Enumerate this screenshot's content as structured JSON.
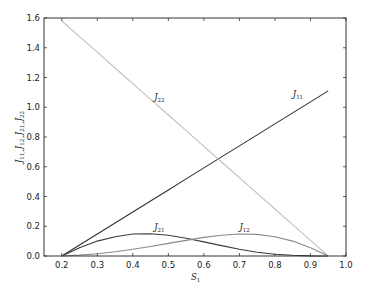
{
  "chart_data": {
    "type": "line",
    "title": "",
    "xlabel": "S_1",
    "ylabel": "J_11, J_12, J_21, J_22",
    "xlim": [
      0.15,
      1.0
    ],
    "ylim": [
      0.0,
      1.6
    ],
    "grid": false,
    "legend": "none (inline curve labels)",
    "xticks": [
      "0.2",
      "0.3",
      "0.4",
      "0.5",
      "0.6",
      "0.7",
      "0.8",
      "0.9",
      "1.0"
    ],
    "yticks": [
      "0.0",
      "0.2",
      "0.4",
      "0.6",
      "0.8",
      "1.0",
      "1.2",
      "1.4",
      "1.6"
    ],
    "x": [
      0.2,
      0.25,
      0.3,
      0.35,
      0.4,
      0.45,
      0.5,
      0.55,
      0.6,
      0.65,
      0.7,
      0.75,
      0.8,
      0.85,
      0.9,
      0.95
    ],
    "series": [
      {
        "name": "J_11",
        "color": "#333333",
        "values": [
          0.0,
          0.074,
          0.148,
          0.222,
          0.296,
          0.37,
          0.444,
          0.518,
          0.592,
          0.666,
          0.74,
          0.814,
          0.888,
          0.962,
          1.036,
          1.11
        ],
        "label_pos": [
          0.85,
          1.07
        ]
      },
      {
        "name": "J_22",
        "color": "#c0c0c0",
        "values": [
          1.58,
          1.475,
          1.37,
          1.264,
          1.159,
          1.053,
          0.948,
          0.843,
          0.737,
          0.632,
          0.527,
          0.421,
          0.316,
          0.211,
          0.105,
          0.0
        ],
        "label_pos": [
          0.46,
          1.05
        ]
      },
      {
        "name": "J_21",
        "color": "#3a3a3a",
        "values": [
          0.0,
          0.055,
          0.1,
          0.13,
          0.148,
          0.15,
          0.14,
          0.12,
          0.095,
          0.07,
          0.045,
          0.025,
          0.012,
          0.005,
          0.001,
          0.0
        ],
        "label_pos": [
          0.46,
          0.175
        ]
      },
      {
        "name": "J_12",
        "color": "#8a8a8a",
        "values": [
          0.0,
          0.006,
          0.015,
          0.028,
          0.045,
          0.064,
          0.085,
          0.105,
          0.125,
          0.14,
          0.148,
          0.145,
          0.13,
          0.1,
          0.055,
          0.0
        ],
        "label_pos": [
          0.7,
          0.175
        ]
      }
    ]
  },
  "axes": {
    "xlabel_main": "S",
    "xlabel_sub": "1"
  }
}
